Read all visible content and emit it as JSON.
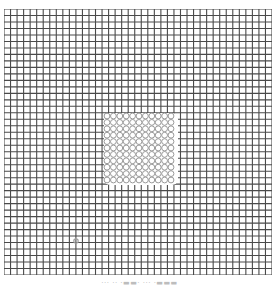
{
  "image": {
    "description": "Square grid test pattern (Amsler-style) with a distorted/blurred central patch and a small defect spot in the lower-left",
    "grid": {
      "columns": 41,
      "rows": 41,
      "line_color": "#4a4a4a",
      "background": "#ffffff",
      "distortion_region": {
        "x": 104,
        "y": 113,
        "width": 74,
        "height": 72,
        "color": "#9a9a9a"
      },
      "spot": {
        "x": 76,
        "y": 241,
        "color": "#a0a0a0"
      }
    },
    "caption": "··· ·· ·▬▬· ··· ·▬▬▬"
  }
}
